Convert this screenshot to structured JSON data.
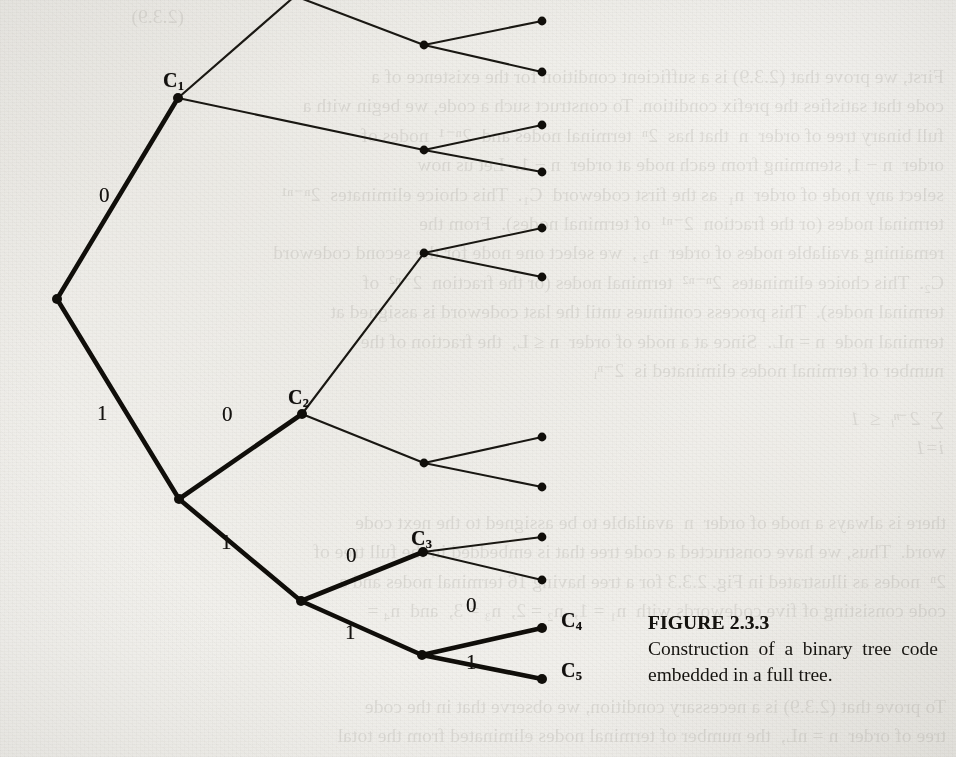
{
  "document": {
    "kind": "scanned-textbook-page",
    "paper_color": "#f3f2ef",
    "ink_color": "#14120f"
  },
  "figure": {
    "number_label": "FIGURE 2.3.3",
    "caption_text": "Construction of a binary tree code embedded in a full tree.",
    "codeword_labels": [
      {
        "id": "c1",
        "text": "C",
        "sub": "1",
        "x": 163,
        "y": 70
      },
      {
        "id": "c2",
        "text": "C",
        "sub": "2",
        "x": 288,
        "y": 387
      },
      {
        "id": "c3",
        "text": "C",
        "sub": "3",
        "x": 411,
        "y": 528
      },
      {
        "id": "c4",
        "text": "C",
        "sub": "4",
        "x": 561,
        "y": 610
      },
      {
        "id": "c5",
        "text": "C",
        "sub": "5",
        "x": 561,
        "y": 660
      }
    ],
    "edge_labels": [
      {
        "id": "e-root-0",
        "text": "0",
        "x": 99,
        "y": 185
      },
      {
        "id": "e-root-1",
        "text": "1",
        "x": 97,
        "y": 403
      },
      {
        "id": "e-n1-0",
        "text": "0",
        "x": 222,
        "y": 404
      },
      {
        "id": "e-n1-1",
        "text": "1",
        "x": 221,
        "y": 532
      },
      {
        "id": "e-n2-0",
        "text": "0",
        "x": 346,
        "y": 545
      },
      {
        "id": "e-n2-1",
        "text": "1",
        "x": 345,
        "y": 622
      },
      {
        "id": "e-n3-0",
        "text": "0",
        "x": 466,
        "y": 595
      },
      {
        "id": "e-n3-1",
        "text": "1",
        "x": 466,
        "y": 652
      }
    ]
  },
  "chart_data": {
    "type": "diagram",
    "subtype": "binary-tree",
    "title": "FIGURE 2.3.3",
    "description": "Construction of a binary tree code embedded in a full tree.",
    "alphabet": [
      "0",
      "1"
    ],
    "codewords": [
      {
        "label": "C1",
        "bits": "0"
      },
      {
        "label": "C2",
        "bits": "10"
      },
      {
        "label": "C3",
        "bits": "110"
      },
      {
        "label": "C4",
        "bits": "1110"
      },
      {
        "label": "C5",
        "bits": "1111"
      }
    ],
    "legend": {
      "thick_edges": "code tree (binary tree code)",
      "thin_edges": "remainder of the full binary tree"
    },
    "nodes": [
      {
        "id": "root",
        "x": 57,
        "y": 299,
        "kind": "internal",
        "code_path": true
      },
      {
        "id": "c1",
        "x": 178,
        "y": 98,
        "kind": "codeword",
        "code_path": true
      },
      {
        "id": "n1",
        "x": 179,
        "y": 499,
        "kind": "internal",
        "code_path": true
      },
      {
        "id": "c2",
        "x": 302,
        "y": 414,
        "kind": "codeword",
        "code_path": true
      },
      {
        "id": "n2",
        "x": 301,
        "y": 601,
        "kind": "internal",
        "code_path": true
      },
      {
        "id": "c3",
        "x": 423,
        "y": 552,
        "kind": "codeword",
        "code_path": true
      },
      {
        "id": "n3",
        "x": 422,
        "y": 655,
        "kind": "internal",
        "code_path": true
      },
      {
        "id": "c4",
        "x": 542,
        "y": 628,
        "kind": "terminal",
        "code_path": true
      },
      {
        "id": "c5",
        "x": 542,
        "y": 679,
        "kind": "terminal",
        "code_path": true
      },
      {
        "id": "t0",
        "x": 295,
        "y": -4,
        "kind": "internal",
        "code_path": false
      },
      {
        "id": "a1",
        "x": 424,
        "y": 45,
        "kind": "internal",
        "code_path": false
      },
      {
        "id": "l1",
        "x": 542,
        "y": 21,
        "kind": "terminal",
        "code_path": false
      },
      {
        "id": "l2",
        "x": 542,
        "y": 72,
        "kind": "terminal",
        "code_path": false
      },
      {
        "id": "a2",
        "x": 424,
        "y": 150,
        "kind": "internal",
        "code_path": false
      },
      {
        "id": "l3",
        "x": 542,
        "y": 125,
        "kind": "terminal",
        "code_path": false
      },
      {
        "id": "l4",
        "x": 542,
        "y": 172,
        "kind": "terminal",
        "code_path": false
      },
      {
        "id": "a3",
        "x": 424,
        "y": 253,
        "kind": "internal",
        "code_path": false
      },
      {
        "id": "l5",
        "x": 542,
        "y": 228,
        "kind": "terminal",
        "code_path": false
      },
      {
        "id": "l6",
        "x": 542,
        "y": 277,
        "kind": "terminal",
        "code_path": false
      },
      {
        "id": "a4",
        "x": 424,
        "y": 463,
        "kind": "internal",
        "code_path": false
      },
      {
        "id": "l7",
        "x": 542,
        "y": 437,
        "kind": "terminal",
        "code_path": false
      },
      {
        "id": "l8",
        "x": 542,
        "y": 487,
        "kind": "terminal",
        "code_path": false
      },
      {
        "id": "l9",
        "x": 542,
        "y": 537,
        "kind": "terminal",
        "code_path": false
      },
      {
        "id": "l10",
        "x": 542,
        "y": 580,
        "kind": "terminal",
        "code_path": false
      }
    ],
    "edges": [
      {
        "from": "root",
        "to": "c1",
        "bit": "0",
        "thick": true
      },
      {
        "from": "root",
        "to": "n1",
        "bit": "1",
        "thick": true
      },
      {
        "from": "n1",
        "to": "c2",
        "bit": "0",
        "thick": true
      },
      {
        "from": "n1",
        "to": "n2",
        "bit": "1",
        "thick": true
      },
      {
        "from": "n2",
        "to": "c3",
        "bit": "0",
        "thick": true
      },
      {
        "from": "n2",
        "to": "n3",
        "bit": "1",
        "thick": true
      },
      {
        "from": "n3",
        "to": "c4",
        "bit": "0",
        "thick": true
      },
      {
        "from": "n3",
        "to": "c5",
        "bit": "1",
        "thick": true
      },
      {
        "from": "c1",
        "to": "t0",
        "bit": "",
        "thick": false
      },
      {
        "from": "t0",
        "to": "a1",
        "bit": "",
        "thick": false
      },
      {
        "from": "a1",
        "to": "l1",
        "bit": "",
        "thick": false
      },
      {
        "from": "a1",
        "to": "l2",
        "bit": "",
        "thick": false
      },
      {
        "from": "c1",
        "to": "a2",
        "bit": "",
        "thick": false
      },
      {
        "from": "a2",
        "to": "l3",
        "bit": "",
        "thick": false
      },
      {
        "from": "a2",
        "to": "l4",
        "bit": "",
        "thick": false
      },
      {
        "from": "c2",
        "to": "a3",
        "bit": "",
        "thick": false
      },
      {
        "from": "a3",
        "to": "l5",
        "bit": "",
        "thick": false
      },
      {
        "from": "a3",
        "to": "l6",
        "bit": "",
        "thick": false
      },
      {
        "from": "c2",
        "to": "a4",
        "bit": "",
        "thick": false
      },
      {
        "from": "a4",
        "to": "l7",
        "bit": "",
        "thick": false
      },
      {
        "from": "a4",
        "to": "l8",
        "bit": "",
        "thick": false
      },
      {
        "from": "c3",
        "to": "l9",
        "bit": "",
        "thick": false
      },
      {
        "from": "c3",
        "to": "l10",
        "bit": "",
        "thick": false
      }
    ]
  },
  "bleed_through": {
    "note": "faint mirrored show-through text from the reverse side of the page",
    "blocks": [
      {
        "id": "bt-top-left",
        "x": 14,
        "y": 2,
        "width": 170,
        "lines": [
          "(2.3.9)"
        ]
      },
      {
        "id": "bt-right-1",
        "x": 592,
        "y": 62,
        "width": 352,
        "lines": [
          "First, we prove that (2.3.9) is a sufficient condition for the existence of a",
          "code that satisfies the prefix condition. To construct such a code, we begin with a",
          "full binary tree of order  n  that has  2ⁿ  terminal nodes and  2ⁿ⁻¹  nodes of",
          "order  n − 1, stemming from each node at order  n − 1.  Let us now",
          "select any node of order  n₁  as the first codeword  C₁.  This choice eliminates  2ⁿ⁻ⁿ¹",
          "terminal nodes (or the fraction  2⁻ⁿ¹  of terminal nodes).  From the",
          "remaining available nodes of order  n₂ ,  we select one node for the second codeword",
          "C₂.  This choice eliminates  2ⁿ⁻ⁿ²  terminal nodes (or the fraction  2⁻ⁿ²  of",
          "terminal nodes).  This process continues until the last codeword is assigned at",
          "terminal node  n = nL.  Since at a node of order  n ≤ L,  the fraction of the",
          "number of terminal nodes eliminated is  2⁻ⁿᵢ"
        ]
      },
      {
        "id": "bt-right-2",
        "x": 592,
        "y": 404,
        "width": 352,
        "lines": [
          "∑  2⁻ⁿᵢ  ≤  1",
          "i=1"
        ]
      },
      {
        "id": "bt-right-3",
        "x": 30,
        "y": 508,
        "width": 916,
        "lines": [
          "there is always a node of order  n  available to be assigned to the next code",
          "word.  Thus, we have constructed a code tree that is embedded in the full tree of",
          "2ⁿ  nodes as illustrated in Fig. 2.3.3 for a tree having 16 terminal nodes and a",
          "code consisting of five codewords with  n₁ = 1,  n₂ = 2,  n₃ = 3,  and  n₄ ="
        ]
      },
      {
        "id": "bt-bottom",
        "x": 30,
        "y": 692,
        "width": 916,
        "lines": [
          "To prove that (2.3.9) is a necessary condition, we observe that in the code",
          "tree of order  n = nL,  the number of terminal nodes eliminated from the total"
        ]
      }
    ]
  }
}
